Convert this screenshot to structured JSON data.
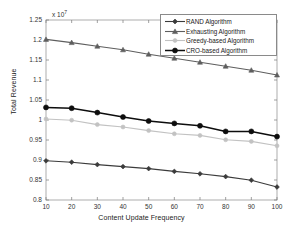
{
  "chart_data": {
    "type": "line",
    "title": "",
    "xlabel": "Content Update Frequency",
    "ylabel": "Total Revenue",
    "exponent_label": "x 10",
    "exponent_power": "7",
    "y_scale": 10000000,
    "x": [
      10,
      20,
      30,
      40,
      50,
      60,
      70,
      80,
      90,
      100
    ],
    "xlim": [
      10,
      100
    ],
    "ylim": [
      0.8,
      1.25
    ],
    "xticks": [
      10,
      20,
      30,
      40,
      50,
      60,
      70,
      80,
      90,
      100
    ],
    "yticks": [
      0.8,
      0.85,
      0.9,
      0.95,
      1,
      1.05,
      1.1,
      1.15,
      1.2,
      1.25
    ],
    "ytick_labels": [
      "0.8",
      "0.85",
      "0.9",
      "0.95",
      "1",
      "1.05",
      "1.1",
      "1.15",
      "1.2",
      "1.25"
    ],
    "xtick_labels": [
      "10",
      "20",
      "30",
      "40",
      "50",
      "60",
      "70",
      "80",
      "90",
      "100"
    ],
    "grid": false,
    "legend_position": "top-right",
    "series": [
      {
        "name": "RAND Algorithm",
        "marker": "diamond",
        "color": "#3b3b3b",
        "values": [
          0.898,
          0.8945,
          0.8885,
          0.8835,
          0.8785,
          0.8715,
          0.8655,
          0.8585,
          0.8495,
          0.8325
        ]
      },
      {
        "name": "Exhausting Algorithm",
        "marker": "triangle",
        "color": "#5e5e5e",
        "values": [
          1.2015,
          1.1935,
          1.1845,
          1.1755,
          1.1645,
          1.1545,
          1.1445,
          1.1345,
          1.1245,
          1.1125
        ]
      },
      {
        "name": "Greedy-based Algorithm",
        "marker": "circle",
        "color": "#c2c2c2",
        "values": [
          1.0025,
          0.9995,
          0.9885,
          0.9825,
          0.9735,
          0.9655,
          0.9615,
          0.9505,
          0.9465,
          0.9355
        ]
      },
      {
        "name": "CRO-based Algorithm",
        "marker": "circle",
        "color": "#0d0d0d",
        "values": [
          1.0315,
          1.0295,
          1.0185,
          1.0075,
          0.9975,
          0.9915,
          0.9855,
          0.9715,
          0.9715,
          0.9585
        ]
      }
    ]
  },
  "legend": {
    "entries": [
      {
        "label": "RAND Algorithm"
      },
      {
        "label": "Exhausting Algorithm"
      },
      {
        "label": "Greedy-based Algorithm"
      },
      {
        "label": "CRO-based Algorithm"
      }
    ]
  },
  "axes": {
    "frame_color": "#9a9a9a",
    "tick_color": "#7a7a7a"
  }
}
